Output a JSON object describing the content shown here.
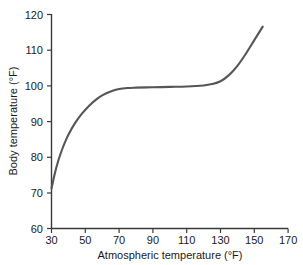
{
  "chart_data": {
    "type": "line",
    "title": "",
    "xlabel": "Atmospheric temperature (°F)",
    "ylabel": "Body temperature (°F)",
    "xlim": [
      30,
      170
    ],
    "ylim": [
      60,
      120
    ],
    "xticks": [
      30,
      50,
      70,
      90,
      110,
      130,
      150,
      170
    ],
    "yticks": [
      60,
      70,
      80,
      90,
      100,
      110,
      120
    ],
    "grid": false,
    "legend": "none",
    "series": [
      {
        "name": "Body temperature response",
        "color": "#56565a",
        "x": [
          30,
          32,
          34,
          36,
          38,
          40,
          44,
          48,
          52,
          56,
          60,
          65,
          70,
          75,
          80,
          90,
          100,
          110,
          120,
          125,
          130,
          135,
          140,
          145,
          150,
          155
        ],
        "y": [
          71.2,
          75.5,
          79.0,
          81.8,
          84.2,
          86.3,
          89.6,
          92.2,
          94.3,
          96.0,
          97.3,
          98.4,
          99.1,
          99.4,
          99.5,
          99.6,
          99.7,
          99.8,
          100.1,
          100.5,
          101.3,
          103.0,
          105.6,
          109.0,
          112.8,
          116.6
        ]
      }
    ],
    "annotations": []
  },
  "axes": {
    "y_tick_labels": [
      "120",
      "110",
      "100",
      "90",
      "80",
      "70",
      "60"
    ],
    "x_tick_labels": [
      "30",
      "50",
      "70",
      "90",
      "110",
      "130",
      "150",
      "170"
    ]
  }
}
